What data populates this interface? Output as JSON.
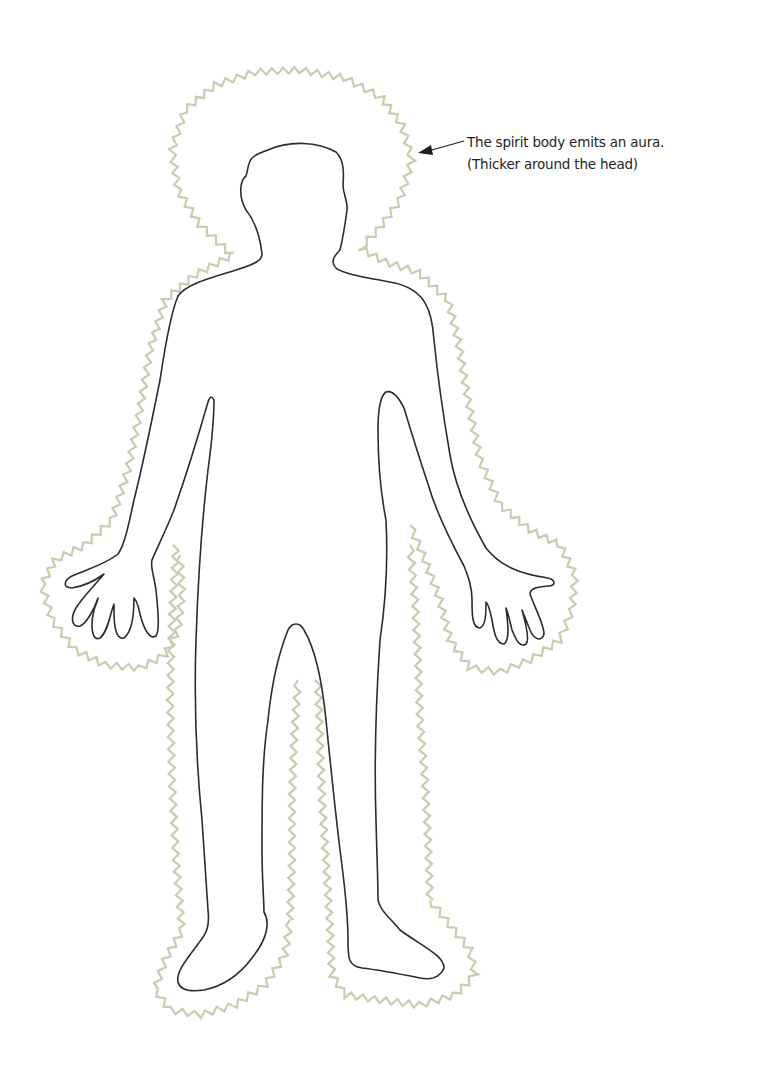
{
  "diagram": {
    "annotation": {
      "line1": "The spirit body emits an aura.",
      "line2": "(Thicker around the head)"
    },
    "colors": {
      "outline": "#2b2b2b",
      "aura": "#c9ccad",
      "arrow": "#231f20",
      "text": "#231f20",
      "background": "#ffffff"
    }
  }
}
